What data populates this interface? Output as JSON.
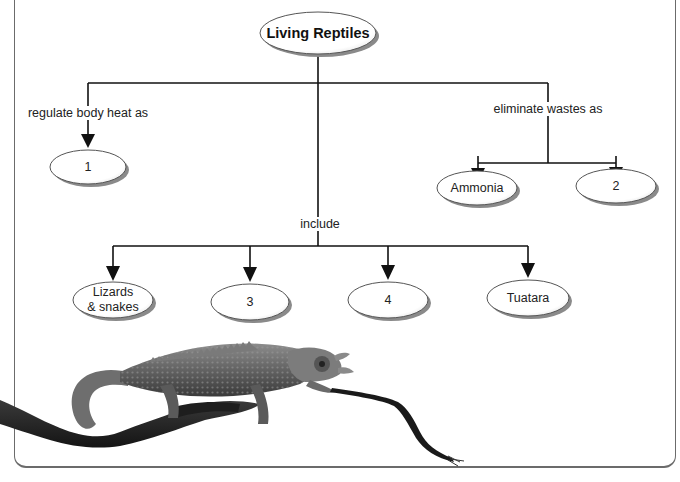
{
  "concept_map": {
    "root": {
      "label": "Living Reptiles"
    },
    "branches": [
      {
        "link_label": "regulate body heat as",
        "targets": [
          {
            "label": "1"
          }
        ]
      },
      {
        "link_label": "eliminate wastes as",
        "targets": [
          {
            "label": "Ammonia"
          },
          {
            "label": "2"
          }
        ]
      },
      {
        "link_label": "include",
        "targets": [
          {
            "label": "Lizards\n& snakes"
          },
          {
            "label": "3"
          },
          {
            "label": "4"
          },
          {
            "label": "Tuatara"
          }
        ]
      }
    ]
  },
  "illustration": {
    "subject": "chameleon on a branch extending its tongue"
  },
  "colors": {
    "line": "#111111",
    "ellipse_stroke": "#555555",
    "ellipse_shadow": "#8a8a8a",
    "frame": "#6b6b6b"
  }
}
